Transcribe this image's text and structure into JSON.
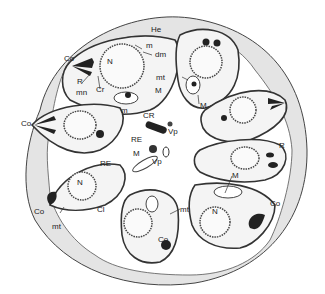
{
  "figure": {
    "type": "biological cross-section line drawing",
    "colors": {
      "background": "#ffffff",
      "matrix": "#e4e4e4",
      "ink": "#333333",
      "cell_fill": "#f4f4f4",
      "dark": "#222222"
    }
  },
  "labels": {
    "He": "He",
    "m_top": "m",
    "dm": "dm",
    "Co_topleft": "Co",
    "N_topleft": "N",
    "R_topleft": "R",
    "mn": "mn",
    "Cr": "Cr",
    "mt_top": "mt",
    "M_topleft": "M",
    "M_topright": "M",
    "m_mid": "m",
    "CR": "CR",
    "Vp_upper": "Vp",
    "Co_left": "Co",
    "RE_center": "RE",
    "M_center": "M",
    "Vp_lower": "Vp",
    "R_right": "R",
    "RE_lowerleft": "RE",
    "M_lowerright": "M",
    "N_lowerleft": "N",
    "Cl": "Cl",
    "Co_bottomleft": "Co",
    "mt_bottomleft": "mt",
    "mt_bottom": "mt",
    "N_bottomright": "N",
    "Co_bottom": "Co",
    "Co_right": "Co"
  }
}
